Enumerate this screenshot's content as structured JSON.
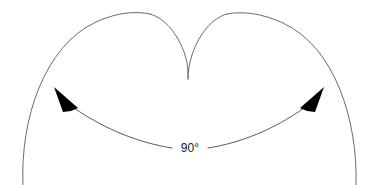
{
  "figure": {
    "type": "geometry-diagram",
    "background_color": "#ffffff",
    "curve_color": "#6b6b6b",
    "arc_color": "#5a5a5a",
    "arrow_color": "#000000",
    "label_color": "#1a1a1a",
    "curve_stroke_width": 1,
    "arc_stroke_width": 1,
    "width": 376,
    "height": 185,
    "title": "Cusped curve with 90 degree angle arc"
  },
  "angle": {
    "label": "90°",
    "value": 90,
    "unit": "degrees",
    "label_x": 190,
    "label_y": 149
  },
  "shape": {
    "name": "heart-cusp-curve",
    "left_lobe_apex": {
      "x": 145,
      "y": 13
    },
    "right_lobe_apex": {
      "x": 240,
      "y": 13
    },
    "cusp_tip": {
      "x": 188,
      "y": 79
    },
    "left_tail_end": {
      "x": 23,
      "y": 185
    },
    "right_tail_end": {
      "x": 356,
      "y": 185
    },
    "left_outer_path": "M 23,185 C 20,120 44,46 96,22 C 118,12 136,11 150,14",
    "left_inner_path": "M 150,14 C 165,18 178,34 185,55 C 188,64 188,72 188,79",
    "right_inner_path": "M 188,79 C 188,72 189,64 192,55 C 199,34 212,18 227,14",
    "right_outer_path": "M 227,14 C 242,11 261,13 283,23 C 335,47 358,121 356,185"
  },
  "angle_arc": {
    "name": "angle-measure-arc",
    "left_segment_path": "M 74,108 C 106,130 140,143 172,148",
    "right_segment_path": "M 208,148 C 240,143 273,130 304,108",
    "gap_for_label": true
  },
  "arrows": [
    {
      "name": "left-arrowhead",
      "direction": "up-left",
      "tip": {
        "x": 54,
        "y": 87
      },
      "polygon": "54,87 78,108 71,111 63,112"
    },
    {
      "name": "right-arrowhead",
      "direction": "up-right",
      "tip": {
        "x": 324,
        "y": 87
      },
      "polygon": "324,87 300,108 307,111 315,112"
    }
  ]
}
